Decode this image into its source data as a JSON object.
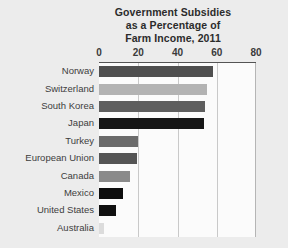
{
  "chart_data": {
    "type": "bar",
    "orientation": "horizontal",
    "title": "Government Subsidies as a Percentage of Farm Income, 2011",
    "title_lines": [
      "Government Subsidies",
      "as a Percentage of",
      "Farm Income, 2011"
    ],
    "xlabel": "",
    "ylabel": "",
    "xlim": [
      0,
      80
    ],
    "xticks": [
      0,
      20,
      40,
      60,
      80
    ],
    "xtick_labels": [
      "0",
      "20",
      "40",
      "60",
      "80"
    ],
    "grid": "vertical",
    "legend": "none",
    "categories": [
      "Norway",
      "Switzerland",
      "South Korea",
      "Japan",
      "Turkey",
      "European Union",
      "Canada",
      "Mexico",
      "United States",
      "Australia"
    ],
    "values": [
      58,
      55,
      54,
      53.5,
      20,
      19.5,
      16,
      12,
      8.5,
      2.5
    ],
    "bar_colors": [
      "#4f4f4f",
      "#b3b3b3",
      "#5e5e5e",
      "#161616",
      "#6b6b6b",
      "#555555",
      "#8a8a8a",
      "#0d0d0d",
      "#101010",
      "#dcdcdc"
    ]
  },
  "style": {
    "background": "#ececec",
    "plot_background": "#fbfbfb",
    "gridline_color": "#c9c9c9",
    "axis_color": "#545454",
    "text_color": "#3d3d3d",
    "title_color": "#2b2b2b"
  }
}
